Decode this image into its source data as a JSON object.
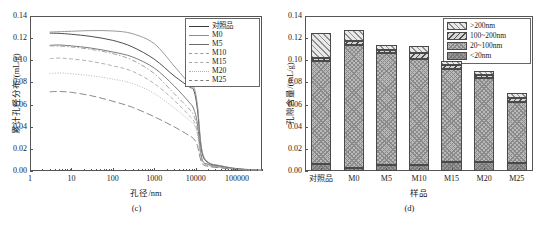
{
  "figure": {
    "panels": [
      "c",
      "d"
    ]
  },
  "chart_data": [
    {
      "type": "line",
      "panel_caption": "(c)",
      "title": "",
      "xlabel": "孔径/nm",
      "ylabel": "累计孔径分布/(mL/g)",
      "xscale": "log",
      "xlim": [
        1,
        400000
      ],
      "ylim": [
        0.0,
        0.14
      ],
      "yticks": [
        "0.00",
        "0.02",
        "0.04",
        "0.06",
        "0.08",
        "0.10",
        "0.12",
        "0.14"
      ],
      "xticks": [
        "1",
        "10",
        "100",
        "1000",
        "10000",
        "100000"
      ],
      "grid": false,
      "legend_position": "top-right",
      "series": [
        {
          "name": "对照品",
          "style": "solid",
          "color": "#3a3a3a",
          "x": [
            3,
            5,
            10,
            30,
            100,
            300,
            1000,
            3000,
            7000,
            9000,
            11000,
            14000,
            20000,
            40000,
            100000,
            400000
          ],
          "values": [
            0.1245,
            0.1243,
            0.1235,
            0.1215,
            0.118,
            0.112,
            0.101,
            0.086,
            0.076,
            0.073,
            0.056,
            0.018,
            0.0075,
            0.0045,
            0.002,
            0.0005
          ]
        },
        {
          "name": "M0",
          "style": "solid-light",
          "color": "#8d8d8d",
          "x": [
            3,
            5,
            10,
            30,
            100,
            300,
            1000,
            3000,
            7000,
            9000,
            11000,
            14000,
            20000,
            40000,
            100000,
            400000
          ],
          "values": [
            0.1255,
            0.1258,
            0.1262,
            0.1268,
            0.1265,
            0.124,
            0.115,
            0.095,
            0.079,
            0.076,
            0.06,
            0.02,
            0.008,
            0.0048,
            0.0022,
            0.0006
          ]
        },
        {
          "name": "M5",
          "style": "solid-mid",
          "color": "#6b6b6b",
          "x": [
            3,
            5,
            10,
            30,
            100,
            300,
            1000,
            3000,
            7000,
            9000,
            11000,
            14000,
            20000,
            40000,
            100000,
            400000
          ],
          "values": [
            0.1135,
            0.1138,
            0.113,
            0.111,
            0.1075,
            0.103,
            0.093,
            0.077,
            0.062,
            0.056,
            0.043,
            0.012,
            0.006,
            0.0038,
            0.0018,
            0.0005
          ]
        },
        {
          "name": "M10",
          "style": "dash-dot",
          "color": "#9a9a9a",
          "x": [
            3,
            5,
            10,
            30,
            100,
            300,
            1000,
            3000,
            7000,
            9000,
            11000,
            14000,
            20000,
            40000,
            100000,
            400000
          ],
          "values": [
            0.113,
            0.1128,
            0.112,
            0.1098,
            0.106,
            0.1,
            0.088,
            0.07,
            0.056,
            0.05,
            0.039,
            0.011,
            0.0058,
            0.0036,
            0.0017,
            0.0005
          ]
        },
        {
          "name": "M15",
          "style": "dashed",
          "color": "#a8a8a8",
          "x": [
            3,
            5,
            10,
            30,
            100,
            300,
            1000,
            3000,
            7000,
            9000,
            11000,
            14000,
            20000,
            40000,
            100000,
            400000
          ],
          "values": [
            0.1015,
            0.102,
            0.1012,
            0.099,
            0.095,
            0.09,
            0.079,
            0.064,
            0.05,
            0.045,
            0.035,
            0.01,
            0.0052,
            0.0033,
            0.0016,
            0.0004
          ]
        },
        {
          "name": "M20",
          "style": "dotted",
          "color": "#b0b0b0",
          "x": [
            3,
            5,
            10,
            30,
            100,
            300,
            1000,
            3000,
            7000,
            9000,
            11000,
            14000,
            20000,
            40000,
            100000,
            400000
          ],
          "values": [
            0.088,
            0.0885,
            0.0878,
            0.086,
            0.083,
            0.079,
            0.07,
            0.057,
            0.046,
            0.042,
            0.033,
            0.0095,
            0.005,
            0.0032,
            0.0015,
            0.0004
          ]
        },
        {
          "name": "M25",
          "style": "long-dash",
          "color": "#7d7d7d",
          "x": [
            3,
            5,
            10,
            30,
            100,
            300,
            1000,
            3000,
            7000,
            9000,
            11000,
            14000,
            20000,
            40000,
            100000,
            400000
          ],
          "values": [
            0.0715,
            0.0718,
            0.071,
            0.068,
            0.063,
            0.0575,
            0.049,
            0.04,
            0.032,
            0.029,
            0.023,
            0.0075,
            0.0042,
            0.0028,
            0.0013,
            0.0003
          ]
        }
      ]
    },
    {
      "type": "bar",
      "stacked": true,
      "panel_caption": "(d)",
      "title": "",
      "xlabel": "样品",
      "ylabel": "孔隙含量/(mL/g)",
      "ylim": [
        0.0,
        0.14
      ],
      "yticks": [
        "0.00",
        "0.02",
        "0.04",
        "0.06",
        "0.08",
        "0.10",
        "0.12",
        "0.14"
      ],
      "categories": [
        "对照品",
        "M0",
        "M5",
        "M10",
        "M15",
        "M20",
        "M25"
      ],
      "grid": false,
      "legend_position": "top-right",
      "series": [
        {
          "name": "<20nm",
          "pattern": "pat-lt20",
          "values": [
            0.0065,
            0.003,
            0.0055,
            0.0055,
            0.008,
            0.0085,
            0.0075
          ]
        },
        {
          "name": "20~100nm",
          "pattern": "pat-20-100",
          "values": [
            0.093,
            0.1105,
            0.101,
            0.0955,
            0.0845,
            0.0755,
            0.0545
          ]
        },
        {
          "name": "100~200nm",
          "pattern": "pat-100-200",
          "values": [
            0.003,
            0.0035,
            0.003,
            0.0055,
            0.003,
            0.0025,
            0.0035
          ]
        },
        {
          "name": ">200nm",
          "pattern": "pat-gt200",
          "values": [
            0.022,
            0.0105,
            0.0045,
            0.006,
            0.0035,
            0.0035,
            0.005
          ]
        }
      ],
      "totals": [
        0.1245,
        0.1275,
        0.114,
        0.1125,
        0.099,
        0.09,
        0.0705
      ]
    }
  ]
}
